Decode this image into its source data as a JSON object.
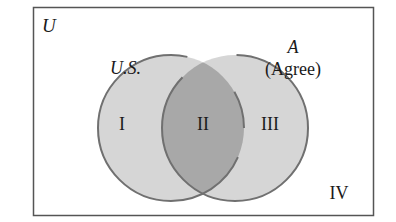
{
  "diagram": {
    "type": "venn",
    "universe_label": "U",
    "sets": [
      {
        "id": "us",
        "label": "U.S."
      },
      {
        "id": "a",
        "label": "A",
        "sublabel": "(Agree)"
      }
    ],
    "regions": [
      {
        "id": "I",
        "label": "I"
      },
      {
        "id": "II",
        "label": "II"
      },
      {
        "id": "III",
        "label": "III"
      },
      {
        "id": "IV",
        "label": "IV"
      }
    ],
    "colors": {
      "border": "#555555",
      "circle_fill": "#d6d6d6",
      "circle_stroke": "#707070",
      "intersection_fill": "#a8a8a8",
      "text": "#1a1a1a"
    }
  }
}
